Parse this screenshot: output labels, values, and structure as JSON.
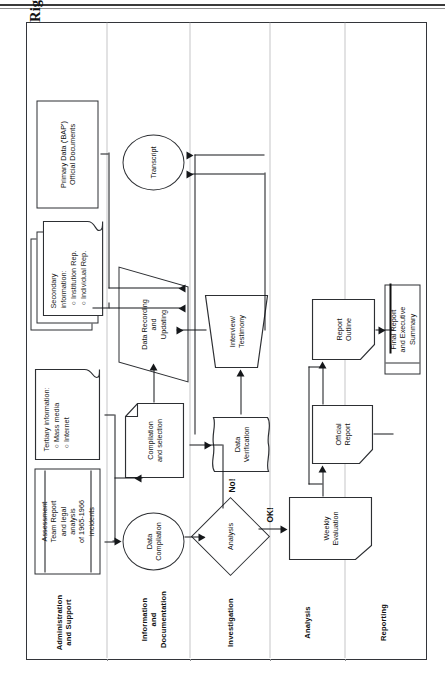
{
  "page": {
    "title": "Annex 2. Implementation process of investigations (Indonesian National Commission on Human Rights)"
  },
  "lanes": [
    {
      "id": "administration",
      "label": "Administration\nand Support"
    },
    {
      "id": "information",
      "label": "Information\nand Documentation"
    },
    {
      "id": "investigation",
      "label": "Investigation"
    },
    {
      "id": "analysis",
      "label": "Analysis"
    },
    {
      "id": "reporting",
      "label": "Reporting"
    }
  ],
  "nodes": {
    "assessment_report": "Assessment\nTeam Report\nand legal\nanalysis\nof 1965-1966\nincidents",
    "tertiary_info_title": "Tertiary information:",
    "tertiary_info_items": "○  Mass media\n○  Internet",
    "secondary_info_title": "Secondary\ninformation:",
    "secondary_info_items": "○  Institution Rep.\n○  Individual Rep.",
    "primary_data": "Primary Data ('BAP')\nOfficial Documents",
    "data_compilation": "Data\nCompilation",
    "compilation_selection": "Compilation\nand selection",
    "data_recording": "Data Recording\nand\nUpdating",
    "transcript": "Transcript",
    "analysis_decision": "Analysis",
    "data_verification": "Data\nVerification",
    "interview_testimony": "Interview/\nTestimony",
    "weekly_evaluation": "Weekly\nEvaluation",
    "official_report": "Official\nReport",
    "report_outline": "Report\nOutline",
    "final_report": "Final Report\nand Executive\nSummary"
  },
  "edge_labels": {
    "ok": "OK!",
    "no": "No!"
  },
  "colors": {
    "stroke": "#2d2f33",
    "connector": "#15171a",
    "lane_divider": "#8a8c90",
    "background": "#ffffff"
  }
}
